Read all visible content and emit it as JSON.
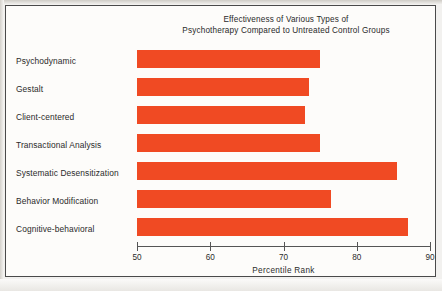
{
  "chart_data": {
    "type": "bar",
    "orientation": "horizontal",
    "title": "Effectiveness of Various Types of Psychotherapy Compared to Untreated Control Groups",
    "title_line1": "Effectiveness of Various Types of",
    "title_line2": "Psychotherapy Compared to Untreated Control Groups",
    "categories": [
      "Psychodynamic",
      "Gestalt",
      "Client-centered",
      "Transactional Analysis",
      "Systematic Desensitization",
      "Behavior Modification",
      "Cognitive-behavioral"
    ],
    "values": [
      75,
      73.5,
      73,
      75,
      85.5,
      76.5,
      87
    ],
    "xlabel": "Percentile Rank",
    "ylabel": "",
    "xlim": [
      50,
      90
    ],
    "xticks": [
      50,
      60,
      70,
      80,
      90
    ],
    "xtick_labels": [
      "50",
      "60",
      "70",
      "80",
      "90"
    ],
    "grid": false,
    "legend": false,
    "bar_color": "#f04a23",
    "frame_color": "#4a4a4a",
    "background": "#fdfcfa"
  }
}
